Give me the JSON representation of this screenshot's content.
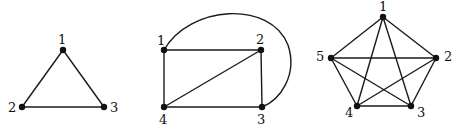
{
  "diagram": {
    "title": "",
    "graphs": [
      {
        "name": "K3",
        "nodes": [
          {
            "id": "1",
            "label": "1",
            "x": 63,
            "y": 50,
            "lx": 58,
            "ly": 44
          },
          {
            "id": "2",
            "label": "2",
            "x": 22,
            "y": 107,
            "lx": 8,
            "ly": 112
          },
          {
            "id": "3",
            "label": "3",
            "x": 104,
            "y": 107,
            "lx": 110,
            "ly": 112
          }
        ],
        "edges": [
          [
            "1",
            "2"
          ],
          [
            "1",
            "3"
          ],
          [
            "2",
            "3"
          ]
        ]
      },
      {
        "name": "K4",
        "nodes": [
          {
            "id": "1",
            "label": "1",
            "x": 164,
            "y": 50,
            "lx": 157,
            "ly": 45
          },
          {
            "id": "2",
            "label": "2",
            "x": 261,
            "y": 50,
            "lx": 256,
            "ly": 44
          },
          {
            "id": "3",
            "label": "3",
            "x": 262,
            "y": 107,
            "lx": 257,
            "ly": 124
          },
          {
            "id": "4",
            "label": "4",
            "x": 164,
            "y": 107,
            "lx": 159,
            "ly": 124
          }
        ],
        "edges": [
          [
            "1",
            "2"
          ],
          [
            "2",
            "3"
          ],
          [
            "3",
            "4"
          ],
          [
            "4",
            "1"
          ],
          [
            "4",
            "2"
          ]
        ],
        "curved_edges": [
          {
            "from": "1",
            "to": "3",
            "path": "M164,50 C190,5 270,0 288,45 C298,75 280,100 262,107"
          }
        ]
      },
      {
        "name": "K5",
        "nodes": [
          {
            "id": "1",
            "label": "1",
            "x": 383,
            "y": 17,
            "lx": 379,
            "ly": 11
          },
          {
            "id": "2",
            "label": "2",
            "x": 436,
            "y": 58,
            "lx": 444,
            "ly": 61
          },
          {
            "id": "3",
            "label": "3",
            "x": 411,
            "y": 106,
            "lx": 417,
            "ly": 117
          },
          {
            "id": "4",
            "label": "4",
            "x": 357,
            "y": 106,
            "lx": 345,
            "ly": 117
          },
          {
            "id": "5",
            "label": "5",
            "x": 331,
            "y": 58,
            "lx": 316,
            "ly": 61
          }
        ],
        "edges": [
          [
            "1",
            "2"
          ],
          [
            "1",
            "3"
          ],
          [
            "1",
            "4"
          ],
          [
            "1",
            "5"
          ],
          [
            "2",
            "3"
          ],
          [
            "2",
            "4"
          ],
          [
            "2",
            "5"
          ],
          [
            "3",
            "4"
          ],
          [
            "3",
            "5"
          ],
          [
            "4",
            "5"
          ]
        ]
      }
    ],
    "colors": {
      "stroke": "#1a1a1a",
      "node": "#111111",
      "background": "#ffffff"
    }
  }
}
